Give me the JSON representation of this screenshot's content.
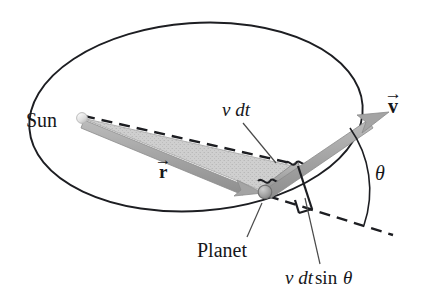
{
  "labels": {
    "sun": "Sun",
    "planet": "Planet",
    "v_dt": "v dt",
    "v_dt_sin_theta": {
      "v": "v",
      "dt": "dt",
      "sin": "sin",
      "theta": "θ"
    },
    "theta": "θ",
    "r_vector": {
      "symbol": "r",
      "accent": "→"
    },
    "v_vector": {
      "symbol": "v",
      "accent": "→"
    }
  },
  "colors": {
    "background": "#ffffff",
    "ink": "#16171a",
    "orbit_stroke": "#1d1e22",
    "swept_area_fill": "#c9c9c9",
    "swept_area_edge": "#a8a8a8",
    "arrow_gray": "#a9a9a9",
    "arrow_gray_dark": "#8d8d8d",
    "planet_body": "#a6a6a6",
    "planet_edge": "#6f6f6f",
    "sun_body": "#e2e2e2",
    "sun_edge": "#b5b5b5",
    "leader_line": "#4a4a4a",
    "dash_stroke": "#1d1e22"
  },
  "geometry": {
    "canvas": {
      "width": 427,
      "height": 303
    },
    "ellipse": {
      "cx": 196,
      "cy": 117,
      "rx": 167,
      "ry": 94,
      "rotation_deg": -4
    },
    "sun": {
      "x": 82,
      "y": 118,
      "r": 5.2
    },
    "planet": {
      "x": 265,
      "y": 192,
      "r": 6.6
    },
    "v_dt_end": {
      "x": 297,
      "y": 167
    },
    "velocity_tip": {
      "x": 388,
      "y": 113
    },
    "r_dashed_extension_end": {
      "x": 392,
      "y": 234
    },
    "theta_arc": {
      "center_x": 265,
      "center_y": 192,
      "radius": 108
    },
    "right_angle_mark": {
      "x": 294,
      "y": 182
    }
  }
}
